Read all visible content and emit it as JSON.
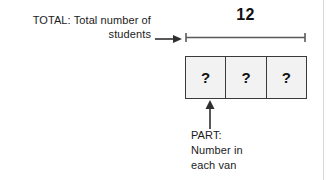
{
  "diagram": {
    "type": "tape-diagram",
    "total_label": {
      "lines": [
        "TOTAL: Total number of",
        "students"
      ]
    },
    "total_value": "12",
    "parts": [
      {
        "mark": "?"
      },
      {
        "mark": "?"
      },
      {
        "mark": "?"
      }
    ],
    "part_label": {
      "lines": [
        "PART:",
        "Number in",
        "each van"
      ]
    },
    "colors": {
      "box_fill": "#f2f2f2",
      "box_border": "#3a3a3a",
      "text": "#1b1b1b",
      "rule": "#5a5a5a"
    }
  }
}
